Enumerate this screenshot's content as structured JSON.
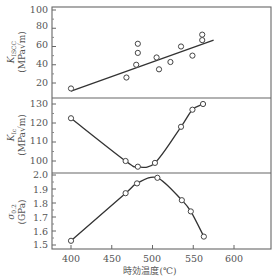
{
  "chart_data": {
    "type": "scatter",
    "layout": "three vertically stacked panels sharing x-axis",
    "xlabel": "時効温度(℃)",
    "x_ticks": [
      400,
      450,
      500,
      550,
      600
    ],
    "xlim": [
      378,
      640
    ],
    "panels": [
      {
        "id": "kiscc",
        "ylabel_main": "K",
        "ylabel_sub": "ISCC",
        "ylabel_unit": "(MPa√m)",
        "y_ticks": [
          20,
          40,
          60,
          80,
          100
        ],
        "ylim": [
          4,
          106
        ],
        "grid": false,
        "points": [
          {
            "x": 400,
            "y": 14
          },
          {
            "x": 468,
            "y": 26
          },
          {
            "x": 482,
            "y": 63
          },
          {
            "x": 482,
            "y": 53
          },
          {
            "x": 480,
            "y": 40
          },
          {
            "x": 505,
            "y": 48
          },
          {
            "x": 508,
            "y": 35
          },
          {
            "x": 522,
            "y": 43
          },
          {
            "x": 535,
            "y": 60
          },
          {
            "x": 549,
            "y": 50
          },
          {
            "x": 561,
            "y": 73
          },
          {
            "x": 561,
            "y": 67
          }
        ],
        "fit": {
          "kind": "linear",
          "x": [
            400,
            575
          ],
          "y": [
            11,
            67
          ]
        }
      },
      {
        "id": "kic",
        "ylabel_main": "K",
        "ylabel_sub": "Ic",
        "ylabel_unit": "(MPa√m)",
        "y_ticks": [
          100,
          110,
          120,
          130
        ],
        "ylim": [
          94,
          133
        ],
        "grid": false,
        "points": [
          {
            "x": 400,
            "y": 122.5
          },
          {
            "x": 467,
            "y": 100
          },
          {
            "x": 482,
            "y": 97
          },
          {
            "x": 503,
            "y": 99
          },
          {
            "x": 535,
            "y": 118
          },
          {
            "x": 549,
            "y": 127
          },
          {
            "x": 562,
            "y": 130
          }
        ],
        "fit": {
          "kind": "smooth"
        }
      },
      {
        "id": "sigma",
        "ylabel_main": "σ",
        "ylabel_sub": "0.2",
        "ylabel_unit": "(GPa)",
        "y_ticks": [
          1.5,
          1.6,
          1.7,
          1.8,
          1.9,
          2.0
        ],
        "y_tick_labels": [
          "1.5",
          "1.6",
          "1.7",
          "1.8",
          "1.9",
          "2.0"
        ],
        "ylim": [
          1.47,
          2.02
        ],
        "grid": false,
        "points": [
          {
            "x": 400,
            "y": 1.53
          },
          {
            "x": 467,
            "y": 1.87
          },
          {
            "x": 481,
            "y": 1.94
          },
          {
            "x": 506,
            "y": 1.98
          },
          {
            "x": 536,
            "y": 1.82
          },
          {
            "x": 547,
            "y": 1.74
          },
          {
            "x": 563,
            "y": 1.56
          }
        ],
        "fit": {
          "kind": "smooth"
        }
      }
    ]
  },
  "labels": {
    "xlabel": "時効温度(℃)",
    "p1_main": "K",
    "p1_sub": "ISCC",
    "p1_unit": "(MPa√m)",
    "p2_main": "K",
    "p2_sub": "Ic",
    "p2_unit": "(MPa√m)",
    "p3_main": "σ",
    "p3_sub": "0.2",
    "p3_unit": "(GPa)",
    "x_ticks": [
      "400",
      "450",
      "500",
      "550",
      "600"
    ],
    "p1_ticks": [
      "20",
      "40",
      "60",
      "80",
      "100"
    ],
    "p2_ticks": [
      "100",
      "110",
      "120",
      "130"
    ],
    "p3_ticks": [
      "1.5",
      "1.6",
      "1.7",
      "1.8",
      "1.9",
      "2.0"
    ]
  }
}
